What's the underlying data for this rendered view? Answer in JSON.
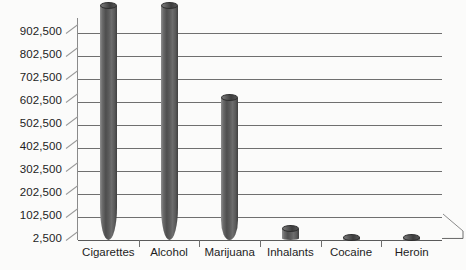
{
  "chart_data": {
    "type": "bar",
    "title": "",
    "subtitle": "",
    "xlabel": "",
    "ylabel": "",
    "categories": [
      "Cigarettes",
      "Alcohol",
      "Marijuana",
      "Inhalants",
      "Cocaine",
      "Heroin"
    ],
    "values": [
      1020000,
      1020000,
      620000,
      52000,
      12000,
      6000
    ],
    "ytick_labels": [
      "2,500",
      "102,500",
      "202,500",
      "302,500",
      "402,500",
      "502,500",
      "602,500",
      "702,500",
      "802,500",
      "902,500"
    ],
    "ytick_values": [
      2500,
      102500,
      202500,
      302500,
      402500,
      502500,
      602500,
      702500,
      802500,
      902500
    ],
    "ylim": [
      2500,
      1042500
    ],
    "grid": true,
    "legend": false,
    "legend_position": "none",
    "bar_style": "3d-cylinder",
    "colors": {
      "background": "#fbfbfa",
      "bar": "#5a5a5a",
      "bar_highlight": "#8f8f8f",
      "bar_shadow": "#3f3f3f",
      "gridline": "#6f6f6f",
      "axis": "#8a8a8a",
      "text": "#1d1d1d"
    }
  }
}
